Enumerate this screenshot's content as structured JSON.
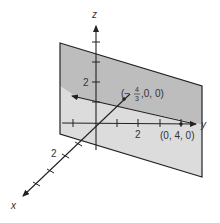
{
  "figure": {
    "axes": {
      "x": {
        "label": "x",
        "tick_label": "2"
      },
      "y": {
        "label": "y",
        "tick_label": "2"
      },
      "z": {
        "label": "z",
        "tick_label": "2"
      }
    },
    "points": [
      {
        "name": "x-intercept",
        "label_prefix": "(−",
        "label_num": "4",
        "label_den": "3",
        "label_suffix": ",0, 0)"
      },
      {
        "name": "y-intercept",
        "label": "(0, 4, 0)"
      }
    ],
    "colors": {
      "plane_upper": "#b9b9b9",
      "plane_lower": "#d9d9d9",
      "lines": "#222222",
      "text": "#333333"
    }
  }
}
